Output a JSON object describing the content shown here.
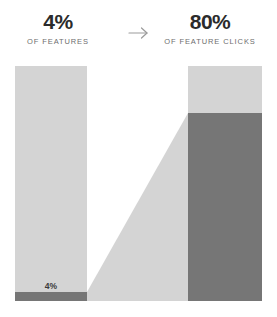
{
  "header": {
    "left": {
      "value": "4%",
      "caption": "OF FEATURES"
    },
    "arrow": {
      "icon": "arrow-right-icon"
    },
    "right": {
      "value": "80%",
      "caption": "OF FEATURE CLICKS"
    }
  },
  "colors": {
    "background": "#ffffff",
    "bar_light": "#d4d4d4",
    "bar_dark": "#767676",
    "wedge": "#d4d4d4",
    "value_text": "#2b2b2b",
    "caption_text": "#6e6e6e",
    "in_bar_label_text": "#3a3a3a",
    "arrow": "#9b9b9b"
  },
  "chart_data": {
    "type": "bar",
    "title": "",
    "subtitle": "",
    "xlabel": "",
    "ylabel": "",
    "ylim": [
      0,
      100
    ],
    "grid": false,
    "legend": false,
    "categories": [
      "Features",
      "Feature clicks"
    ],
    "series": [
      {
        "name": "Highlighted share",
        "values": [
          4,
          80
        ],
        "color": "#767676"
      },
      {
        "name": "Remainder",
        "values": [
          96,
          20
        ],
        "color": "#d4d4d4"
      }
    ],
    "annotations": [
      {
        "text": "4%",
        "target": "Features",
        "position": "inside-bottom"
      }
    ],
    "connector": {
      "type": "wedge",
      "from_category": "Features",
      "from_value": 4,
      "to_category": "Feature clicks",
      "to_value": 80,
      "color": "#d4d4d4"
    }
  }
}
